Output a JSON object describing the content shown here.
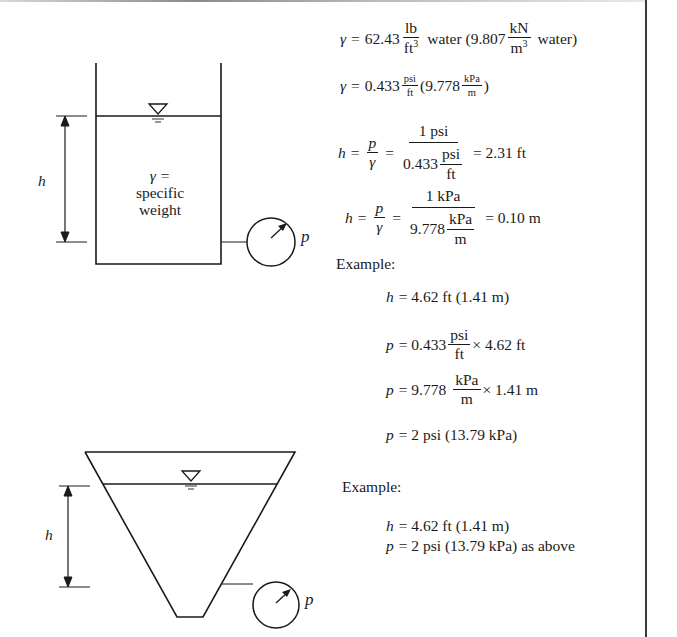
{
  "diagram": {
    "tank1": {
      "height_label": "h",
      "fluid_label_line1": "γ =",
      "fluid_label_line2": "specific",
      "fluid_label_line3": "weight",
      "gauge_label": "p"
    },
    "tank2": {
      "height_label": "h",
      "gauge_label": "p"
    }
  },
  "equations": {
    "gamma1": {
      "lhs": "γ",
      "eq": "=",
      "value": "62.43",
      "num": "lb",
      "den": "ft",
      "den_sup": "3",
      "text1": "water (9.807",
      "num2": "kN",
      "den2": "m",
      "den2_sup": "3",
      "text2": "water)"
    },
    "gamma2": {
      "lhs": "γ",
      "eq": "=",
      "value": "0.433",
      "num": "psi",
      "den": "ft",
      "text1": "(9.778",
      "num2": "kPa",
      "den2": "m",
      "text2": ")"
    },
    "h_imperial": {
      "lhs": "h",
      "eq": "=",
      "frac_num": "p",
      "frac_den": "γ",
      "eq2": "=",
      "big_num": "1 psi",
      "big_den_value": "0.433",
      "big_den_num": "psi",
      "big_den_den": "ft",
      "result": "= 2.31 ft"
    },
    "h_metric": {
      "lhs": "h",
      "eq": "=",
      "frac_num": "p",
      "frac_den": "γ",
      "eq2": "=",
      "big_num": "1 kPa",
      "big_den_value": "9.778",
      "big_den_num": "kPa",
      "big_den_den": "m",
      "result": "= 0.10 m"
    },
    "example1": {
      "heading": "Example:",
      "line1_var": "h",
      "line1_text": "= 4.62 ft (1.41 m)",
      "line2_var": "p",
      "line2_value": "= 0.433",
      "line2_num": "psi",
      "line2_den": "ft",
      "line2_tail": "× 4.62 ft",
      "line3_var": "p",
      "line3_value": "= 9.778",
      "line3_num": "kPa",
      "line3_den": "m",
      "line3_tail": "× 1.41 m",
      "line4_var": "p",
      "line4_text": "= 2 psi (13.79 kPa)"
    },
    "example2": {
      "heading": "Example:",
      "line1_var": "h",
      "line1_text": "= 4.62 ft (1.41 m)",
      "line2_var": "p",
      "line2_text": "= 2 psi (13.79 kPa) as above"
    }
  }
}
